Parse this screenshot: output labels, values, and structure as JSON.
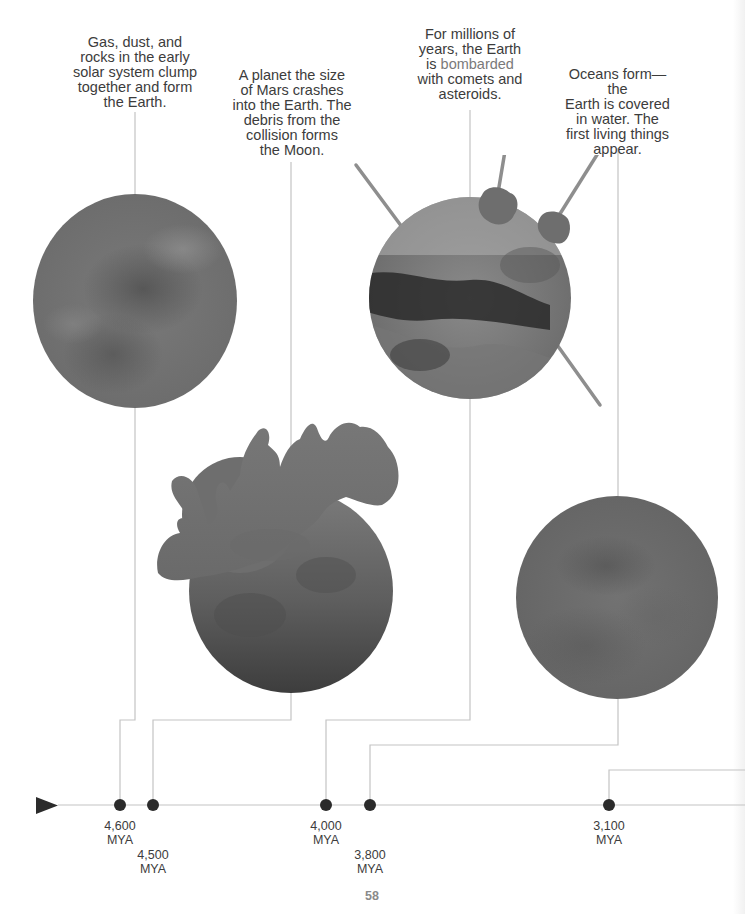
{
  "page": {
    "page_number": "58"
  },
  "events": [
    {
      "caption": [
        "Gas, dust, and",
        "rocks in the early",
        "solar system clump",
        "together and form",
        "the Earth."
      ],
      "date": "4,600",
      "unit": "MYA",
      "illustration": "forming-earth-planet"
    },
    {
      "caption": [
        "A planet the size",
        "of Mars crashes",
        "into the Earth. The",
        "debris from the",
        "collision forms",
        "the Moon."
      ],
      "date": "4,500",
      "unit": "MYA",
      "illustration": "moon-forming-collision"
    },
    {
      "caption_pre": [
        "For millions of",
        "years, the Earth"
      ],
      "caption_line3_pre": "is ",
      "caption_highlight": "bombarded",
      "caption_post": [
        "with comets and",
        "asteroids."
      ],
      "date": "4,000",
      "unit": "MYA",
      "illustration": "bombarded-earth"
    },
    {
      "caption": [
        "Oceans form—the",
        "Earth is covered",
        "in water. The",
        "first living things",
        "appear."
      ],
      "date": "3,800",
      "unit": "MYA",
      "illustration": "ocean-earth"
    },
    {
      "caption": [],
      "date": "3,100",
      "unit": "MYA",
      "illustration": null
    }
  ],
  "timeline": {
    "direction": "left-to-right",
    "arrow": "play-arrow",
    "line_color": "#c8c8c8",
    "dot_color": "#2b2b2b"
  }
}
